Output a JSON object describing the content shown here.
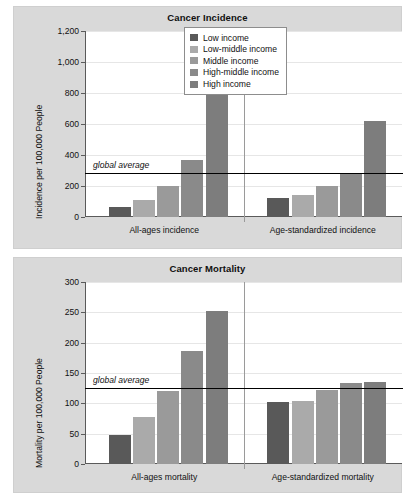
{
  "figure": {
    "background": "#ffffff",
    "panel_background": "#d9d9d9",
    "plot_background": "#ffffff"
  },
  "legend": {
    "position": "top-right of upper chart",
    "entries": [
      {
        "label": "Low income",
        "color": "#595959"
      },
      {
        "label": "Low-middle income",
        "color": "#aaaaaa"
      },
      {
        "label": "Middle income",
        "color": "#9a9a9a"
      },
      {
        "label": "High-middle income",
        "color": "#8a8a8a"
      },
      {
        "label": "High income",
        "color": "#7d7d7d"
      }
    ]
  },
  "chart_data": [
    {
      "type": "bar",
      "title": "Cancer Incidence",
      "xlabel": "",
      "ylabel": "Incidence per 100,000 People",
      "ylim": [
        0,
        1200
      ],
      "yticks": [
        0,
        200,
        400,
        600,
        800,
        1000,
        1200
      ],
      "ytick_labels": [
        "0",
        "200",
        "400",
        "600",
        "800",
        "1,000",
        "1,200"
      ],
      "grid": true,
      "categories": [
        "All-ages incidence",
        "Age-standardized incidence"
      ],
      "series": [
        {
          "name": "Low income",
          "color": "#595959",
          "values": [
            65,
            120
          ]
        },
        {
          "name": "Low-middle income",
          "color": "#aaaaaa",
          "values": [
            108,
            143
          ]
        },
        {
          "name": "Middle income",
          "color": "#9a9a9a",
          "values": [
            198,
            197
          ]
        },
        {
          "name": "High-middle income",
          "color": "#8a8a8a",
          "values": [
            368,
            275
          ]
        },
        {
          "name": "High income",
          "color": "#7d7d7d",
          "values": [
            1085,
            618
          ]
        }
      ],
      "annotations": [
        {
          "name": "global-average",
          "label": "global average",
          "value": 287
        }
      ]
    },
    {
      "type": "bar",
      "title": "Cancer Mortality",
      "xlabel": "",
      "ylabel": "Mortality per 100,000 People",
      "ylim": [
        0,
        300
      ],
      "yticks": [
        0,
        50,
        100,
        150,
        200,
        250,
        300
      ],
      "ytick_labels": [
        "0",
        "50",
        "100",
        "150",
        "200",
        "250",
        "300"
      ],
      "grid": true,
      "categories": [
        "All-ages mortality",
        "Age-standardized mortality"
      ],
      "series": [
        {
          "name": "Low income",
          "color": "#595959",
          "values": [
            48,
            102
          ]
        },
        {
          "name": "Low-middle income",
          "color": "#aaaaaa",
          "values": [
            78,
            104
          ]
        },
        {
          "name": "Middle income",
          "color": "#9a9a9a",
          "values": [
            121,
            122
          ]
        },
        {
          "name": "High-middle income",
          "color": "#8a8a8a",
          "values": [
            187,
            133
          ]
        },
        {
          "name": "High income",
          "color": "#7d7d7d",
          "values": [
            252,
            135
          ]
        }
      ],
      "annotations": [
        {
          "name": "global-average",
          "label": "global average",
          "value": 126
        }
      ]
    }
  ]
}
